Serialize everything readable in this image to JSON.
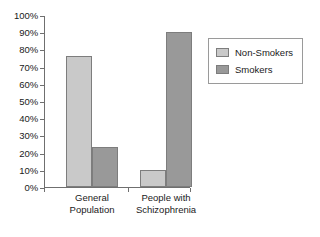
{
  "chart_data": {
    "type": "bar",
    "title": "",
    "xlabel": "",
    "ylabel": "",
    "ylim": [
      0,
      100
    ],
    "ytick_labels": [
      "100%",
      "90%",
      "80%",
      "70%",
      "60%",
      "50%",
      "40%",
      "30%",
      "20%",
      "10%",
      "0%"
    ],
    "ytick_values": [
      100,
      90,
      80,
      70,
      60,
      50,
      40,
      30,
      20,
      10,
      0
    ],
    "grid": false,
    "legend_position": "right",
    "categories": [
      "General Population",
      "People with Schizophrenia"
    ],
    "category_lines": [
      [
        "General",
        "Population"
      ],
      [
        "People with",
        "Schizophrenia"
      ]
    ],
    "series": [
      {
        "name": "Non-Smokers",
        "color": "#c9c9c9",
        "values": [
          76,
          10
        ]
      },
      {
        "name": "Smokers",
        "color": "#999999",
        "values": [
          23,
          90
        ]
      }
    ]
  },
  "legend": {
    "items": [
      {
        "label": "Non-Smokers"
      },
      {
        "label": "Smokers"
      }
    ]
  },
  "axis": {
    "y_labels": [
      "100%",
      "90%",
      "80%",
      "70%",
      "60%",
      "50%",
      "40%",
      "30%",
      "20%",
      "10%",
      "0%"
    ]
  }
}
